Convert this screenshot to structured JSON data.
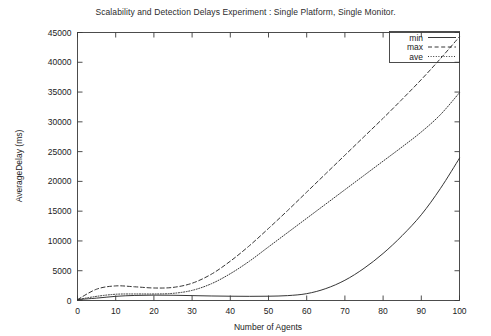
{
  "chart_data": {
    "type": "line",
    "title": "Scalability and Detection Delays Experiment : Single Platform, Single Monitor.",
    "xlabel": "Number of Agents",
    "ylabel": "AverageDelay (ms)",
    "xlim": [
      0,
      100
    ],
    "ylim": [
      0,
      45000
    ],
    "xticks": [
      0,
      10,
      20,
      30,
      40,
      50,
      60,
      70,
      80,
      90,
      100
    ],
    "yticks": [
      0,
      5000,
      10000,
      15000,
      20000,
      25000,
      30000,
      35000,
      40000,
      45000
    ],
    "xtick_labels": [
      "0",
      "10",
      "20",
      "30",
      "40",
      "50",
      "60",
      "70",
      "80",
      "90",
      "100"
    ],
    "ytick_labels": [
      "0",
      "5000",
      "10000",
      "15000",
      "20000",
      "25000",
      "30000",
      "35000",
      "40000",
      "45000"
    ],
    "grid": false,
    "legend_position": "top-right",
    "x": [
      0,
      5,
      10,
      15,
      20,
      25,
      30,
      35,
      40,
      45,
      50,
      55,
      60,
      65,
      70,
      75,
      80,
      85,
      90,
      95,
      100
    ],
    "series": [
      {
        "name": "min",
        "style": "solid",
        "values": [
          150,
          400,
          700,
          850,
          900,
          880,
          820,
          760,
          720,
          700,
          720,
          820,
          1150,
          2000,
          3400,
          5400,
          7900,
          10900,
          14400,
          18800,
          23900
        ]
      },
      {
        "name": "max",
        "style": "dashed",
        "values": [
          150,
          1900,
          2450,
          2300,
          2100,
          2200,
          2900,
          4400,
          6600,
          9200,
          12100,
          15100,
          18200,
          21300,
          24400,
          27500,
          30600,
          33800,
          37100,
          40600,
          44300
        ]
      },
      {
        "name": "ave",
        "style": "dotted",
        "values": [
          150,
          700,
          1050,
          1100,
          1100,
          1200,
          1700,
          2800,
          4500,
          6600,
          9000,
          11400,
          13800,
          16200,
          18600,
          21000,
          23400,
          25800,
          28300,
          31200,
          34900
        ]
      }
    ]
  },
  "legend": {
    "entries": [
      {
        "label": "min"
      },
      {
        "label": "max"
      },
      {
        "label": "ave"
      }
    ]
  },
  "colors": {
    "line": "#2a2a2a",
    "axis": "#3a3a3a",
    "text": "#222222",
    "background": "#ffffff"
  }
}
